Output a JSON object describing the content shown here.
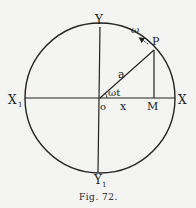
{
  "figure": {
    "caption": "Fig. 72.",
    "labels": {
      "y_top": "Y",
      "y_bottom": "Y",
      "y_bottom_sub": "1",
      "x_left": "X",
      "x_left_sub": "1",
      "x_right": "X",
      "origin": "o",
      "x_var": "x",
      "foot": "M",
      "point": "P",
      "radius": "a",
      "angle": "ωt",
      "angular_velocity": "ω"
    },
    "colors": {
      "ink": "#222222",
      "paper": "#f4f4f2"
    }
  }
}
